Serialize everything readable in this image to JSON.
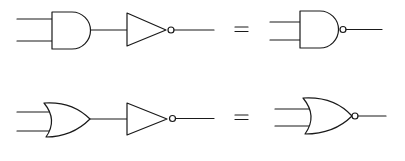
{
  "diagram": {
    "rows": [
      {
        "left": [
          "AND gate",
          "NOT gate (inverter)"
        ],
        "operator": "=",
        "right": "NAND gate"
      },
      {
        "left": [
          "OR gate",
          "NOT gate (inverter)"
        ],
        "operator": "=",
        "right": "NOR gate"
      }
    ],
    "colors": {
      "stroke": "#1a1a1a",
      "background": "#ffffff"
    }
  }
}
